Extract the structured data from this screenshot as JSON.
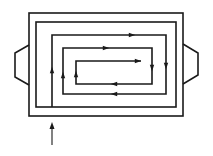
{
  "diagram": {
    "title": "",
    "colors": {
      "line": "#1a1a1a",
      "background": "#ffffff"
    },
    "components": [
      {
        "id": "outer-housing",
        "type": "rectangle"
      },
      {
        "id": "inner-wall",
        "type": "rectangle"
      },
      {
        "id": "left-tab",
        "type": "trapezoid"
      },
      {
        "id": "right-tab",
        "type": "trapezoid"
      },
      {
        "id": "spiral-flow-path",
        "type": "polyline",
        "turns": 9
      },
      {
        "id": "inlet-arrow",
        "type": "arrow",
        "direction": "up"
      }
    ],
    "flow_arrows": [
      {
        "segment": 1,
        "direction": "up"
      },
      {
        "segment": 2,
        "direction": "right"
      },
      {
        "segment": 3,
        "direction": "down"
      },
      {
        "segment": 4,
        "direction": "left"
      },
      {
        "segment": 5,
        "direction": "up"
      },
      {
        "segment": 6,
        "direction": "right"
      },
      {
        "segment": 7,
        "direction": "down"
      },
      {
        "segment": 8,
        "direction": "left"
      },
      {
        "segment": 9,
        "direction": "up"
      },
      {
        "segment": 10,
        "direction": "right"
      }
    ],
    "labels": []
  }
}
